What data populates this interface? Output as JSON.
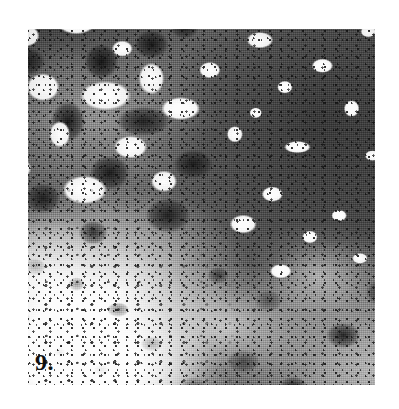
{
  "page": {
    "background_color": "#ffffff",
    "width": 399,
    "height": 409
  },
  "figure": {
    "number_label": "9.",
    "caption": "",
    "kind": "photomicrograph-plate",
    "plate": {
      "left": 28,
      "top": 29,
      "width": 347,
      "height": 356,
      "description": "Grayscale scanned photomicrograph showing a mottled, marbled two-phase microstructure.",
      "tone_colors": {
        "matrix_gray": "#737373",
        "dark_grains": "#1a1a1a",
        "light_phase": "#fafafa",
        "paper_white": "#ffffff"
      },
      "regions": [
        {
          "name": "upper-left",
          "appearance": "dense high-contrast mottling of dark grains and white islands"
        },
        {
          "name": "right-center",
          "appearance": "continuous medium-dark gray matrix field with scattered small bright white patches"
        },
        {
          "name": "lower-left",
          "appearance": "predominantly white field with sparse fine dark speckles"
        },
        {
          "name": "lower-right",
          "appearance": "mixed mottled network of dark branching grains over white"
        }
      ]
    }
  }
}
